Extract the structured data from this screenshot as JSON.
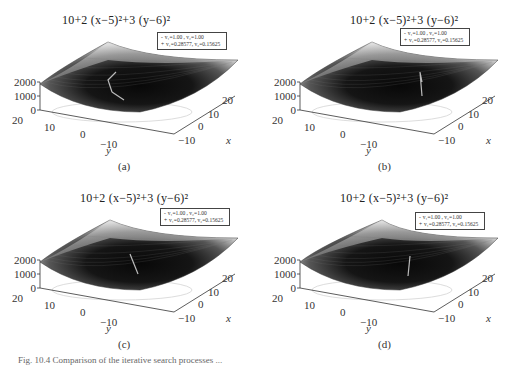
{
  "figure": {
    "caption_fragment": "Fig. 10.4   Comparison of the iterative search processes ..."
  },
  "panels": [
    {
      "id": "a",
      "title": "10+2 (x−5)²+3 (y−6)²",
      "sublabel": "(a)",
      "legend": [
        "v₁=1.00 , v₂=1.00",
        "v₁=0.28577, v₂=0.15625"
      ],
      "z_ticks": [
        "2000",
        "1000",
        "0"
      ],
      "y_ticks": [
        "20",
        "10",
        "0",
        "−10"
      ],
      "x_ticks": [
        "−10",
        "0",
        "10",
        "20"
      ],
      "x_label": "x",
      "y_label": "y"
    },
    {
      "id": "b",
      "title": "10+2 (x−5)²+3 (y−6)²",
      "sublabel": "(b)",
      "legend": [
        "v₁=1.00 , v₂=1.00",
        "v₁=0.28577, v₂=0.15625"
      ],
      "z_ticks": [
        "2000",
        "1000",
        "0"
      ],
      "y_ticks": [
        "20",
        "10",
        "0",
        "−10"
      ],
      "x_ticks": [
        "−10",
        "0",
        "10",
        "20"
      ],
      "x_label": "x",
      "y_label": "y"
    },
    {
      "id": "c",
      "title": "10+2 (x−5)²+3 (y−6)²",
      "sublabel": "(c)",
      "legend": [
        "v₁=1.00 , v₂=1.00",
        "v₁=0.28577, v₂=0.15625"
      ],
      "z_ticks": [
        "2000",
        "1000",
        "0"
      ],
      "y_ticks": [
        "20",
        "10",
        "0",
        "−10"
      ],
      "x_ticks": [
        "−10",
        "0",
        "10",
        "20"
      ],
      "x_label": "x",
      "y_label": "y"
    },
    {
      "id": "d",
      "title": "10+2 (x−5)²+3 (y−6)²",
      "sublabel": "(d)",
      "legend": [
        "v₁=1.00 , v₂=1.00",
        "v₁=0.28577, v₂=0.15625"
      ],
      "z_ticks": [
        "2000",
        "1000",
        "0"
      ],
      "y_ticks": [
        "20",
        "10",
        "0",
        "−10"
      ],
      "x_ticks": [
        "−10",
        "0",
        "10",
        "20"
      ],
      "x_label": "x",
      "y_label": "y"
    }
  ],
  "chart_data": [
    {
      "type": "surface3d",
      "title": "10+2(x-5)^2+3(y-6)^2",
      "function": "z = 10 + 2*(x-5)^2 + 3*(y-6)^2",
      "minimum": {
        "x": 5,
        "y": 6,
        "z": 10
      },
      "xlabel": "x",
      "ylabel": "y",
      "zlabel": "",
      "xlim": [
        -15,
        25
      ],
      "ylim": [
        -15,
        25
      ],
      "zlim": [
        0,
        2000
      ],
      "x_ticks": [
        -10,
        0,
        10,
        20
      ],
      "y_ticks": [
        -10,
        0,
        10,
        20
      ],
      "z_ticks": [
        0,
        1000,
        2000
      ],
      "legend": [
        "v1=1.00, v2=1.00",
        "v1=0.28577, v2=0.15625"
      ],
      "series": [
        {
          "name": "v1=1.00, v2=1.00",
          "kind": "search path"
        },
        {
          "name": "v1=0.28577, v2=0.15625",
          "kind": "search path"
        }
      ],
      "subplot": "(a)"
    },
    {
      "type": "surface3d",
      "title": "10+2(x-5)^2+3(y-6)^2",
      "function": "z = 10 + 2*(x-5)^2 + 3*(y-6)^2",
      "xlim": [
        -15,
        25
      ],
      "ylim": [
        -15,
        25
      ],
      "zlim": [
        0,
        2000
      ],
      "x_ticks": [
        -10,
        0,
        10,
        20
      ],
      "y_ticks": [
        -10,
        0,
        10,
        20
      ],
      "z_ticks": [
        0,
        1000,
        2000
      ],
      "legend": [
        "v1=1.00, v2=1.00",
        "v1=0.28577, v2=0.15625"
      ],
      "subplot": "(b)"
    },
    {
      "type": "surface3d",
      "title": "10+2(x-5)^2+3(y-6)^2",
      "function": "z = 10 + 2*(x-5)^2 + 3*(y-6)^2",
      "xlim": [
        -15,
        25
      ],
      "ylim": [
        -15,
        25
      ],
      "zlim": [
        0,
        2000
      ],
      "x_ticks": [
        -10,
        0,
        10,
        20
      ],
      "y_ticks": [
        -10,
        0,
        10,
        20
      ],
      "z_ticks": [
        0,
        1000,
        2000
      ],
      "legend": [
        "v1=1.00, v2=1.00",
        "v1=0.28577, v2=0.15625"
      ],
      "subplot": "(c)"
    },
    {
      "type": "surface3d",
      "title": "10+2(x-5)^2+3(y-6)^2",
      "function": "z = 10 + 2*(x-5)^2 + 3*(y-6)^2",
      "xlim": [
        -15,
        25
      ],
      "ylim": [
        -15,
        25
      ],
      "zlim": [
        0,
        2000
      ],
      "x_ticks": [
        -10,
        0,
        10,
        20
      ],
      "y_ticks": [
        -10,
        0,
        10,
        20
      ],
      "z_ticks": [
        0,
        1000,
        2000
      ],
      "legend": [
        "v1=1.00, v2=1.00",
        "v1=0.28577, v2=0.15625"
      ],
      "subplot": "(d)"
    }
  ]
}
